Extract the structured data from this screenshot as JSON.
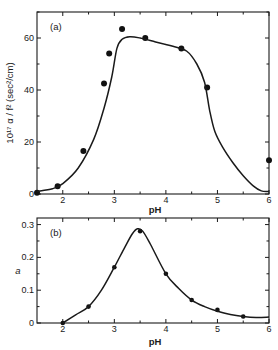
{
  "chart_data": [
    {
      "type": "scatter",
      "panel_label": "(a)",
      "title": "",
      "xlabel": "pH",
      "ylabel": "10¹⁷ α / f² (sec²/cm)",
      "xlim": [
        1.5,
        6
      ],
      "ylim": [
        0,
        70
      ],
      "xticks": [
        2,
        3,
        4,
        5,
        6
      ],
      "yticks": [
        0,
        20,
        40,
        60
      ],
      "grid": false,
      "series": [
        {
          "name": "measured",
          "kind": "points",
          "x": [
            1.5,
            1.9,
            2.4,
            2.8,
            2.9,
            3.15,
            3.6,
            4.3,
            4.8,
            6.0
          ],
          "y": [
            0.5,
            3,
            16.5,
            42.5,
            54,
            63.5,
            60,
            56,
            41,
            13
          ]
        },
        {
          "name": "fit",
          "kind": "line",
          "x": [
            1.5,
            1.8,
            2.0,
            2.3,
            2.6,
            2.8,
            2.95,
            3.05,
            3.15,
            3.3,
            3.5,
            3.8,
            4.1,
            4.4,
            4.6,
            4.75,
            4.85,
            4.95,
            5.1,
            5.3,
            5.5,
            5.7,
            5.85,
            6.0
          ],
          "y": [
            1,
            2,
            4,
            10,
            21,
            33,
            45,
            56,
            59.5,
            60.5,
            60,
            58.5,
            57,
            55,
            50,
            43,
            32,
            24,
            18,
            12,
            7,
            3,
            1.2,
            1
          ]
        }
      ]
    },
    {
      "type": "line",
      "panel_label": "(b)",
      "title": "",
      "xlabel": "pH",
      "ylabel": "a",
      "xlim": [
        1.5,
        6
      ],
      "ylim": [
        0,
        0.32
      ],
      "xticks": [
        2,
        3,
        4,
        5,
        6
      ],
      "yticks": [
        0,
        0.1,
        0.2,
        0.3
      ],
      "ytick_labels": [
        "0",
        "0.1",
        "0.2",
        "0.3"
      ],
      "grid": false,
      "series": [
        {
          "name": "measured",
          "kind": "points",
          "x": [
            2.0,
            2.5,
            3.0,
            3.5,
            4.0,
            4.5,
            5.0,
            5.5
          ],
          "y": [
            0.0,
            0.05,
            0.17,
            0.28,
            0.15,
            0.07,
            0.04,
            0.02
          ]
        },
        {
          "name": "fit",
          "kind": "line",
          "x": [
            2.0,
            2.25,
            2.5,
            2.75,
            3.0,
            3.2,
            3.35,
            3.45,
            3.55,
            3.7,
            4.0,
            4.25,
            4.5,
            4.75,
            5.0,
            5.25,
            5.5,
            5.75,
            6.0
          ],
          "y": [
            0.0,
            0.025,
            0.05,
            0.1,
            0.17,
            0.23,
            0.272,
            0.287,
            0.28,
            0.24,
            0.15,
            0.105,
            0.07,
            0.05,
            0.036,
            0.026,
            0.02,
            0.017,
            0.018
          ]
        }
      ]
    }
  ]
}
